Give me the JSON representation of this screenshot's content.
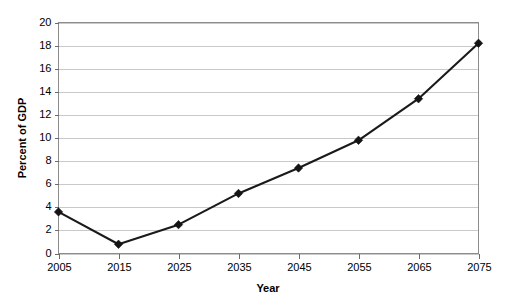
{
  "chart_data": {
    "type": "line",
    "title": "",
    "xlabel": "Year",
    "ylabel": "Percent of GDP",
    "categories": [
      "2005",
      "2015",
      "2025",
      "2035",
      "2045",
      "2055",
      "2065",
      "2075"
    ],
    "x": [
      2005,
      2015,
      2025,
      2035,
      2045,
      2055,
      2065,
      2075
    ],
    "values": [
      3.6,
      0.8,
      2.5,
      5.2,
      7.4,
      9.8,
      13.4,
      18.2
    ],
    "series": [
      {
        "name": "Percent of GDP",
        "values": [
          3.6,
          0.8,
          2.5,
          5.2,
          7.4,
          9.8,
          13.4,
          18.2
        ]
      }
    ],
    "xlim": [
      2005,
      2075
    ],
    "ylim": [
      0,
      20
    ],
    "ytick_labels": [
      "0",
      "2",
      "4",
      "6",
      "8",
      "10",
      "12",
      "14",
      "16",
      "18",
      "20"
    ],
    "yticks": [
      0,
      2,
      4,
      6,
      8,
      10,
      12,
      14,
      16,
      18,
      20
    ],
    "xtick_labels": [
      "2005",
      "2015",
      "2025",
      "2035",
      "2045",
      "2055",
      "2065",
      "2075"
    ],
    "xticks": [
      2005,
      2015,
      2025,
      2035,
      2045,
      2055,
      2065,
      2075
    ],
    "grid": "horizontal",
    "legend": "none",
    "marker": "diamond",
    "line_color": "#1a1a1a",
    "marker_color": "#141414",
    "grid_color": "#c9c9c9",
    "border_color": "#8c8c8c",
    "background_color": "#ffffff"
  }
}
